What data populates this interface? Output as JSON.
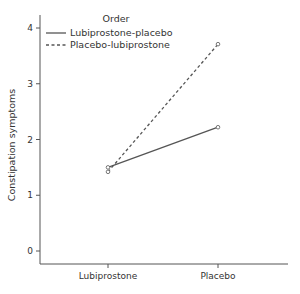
{
  "chart_data": {
    "type": "line",
    "title": "",
    "xlabel": "",
    "ylabel": "Constipation symptoms",
    "categories": [
      "Lubiprostone",
      "Placebo"
    ],
    "ylim": [
      -0.3,
      4.2
    ],
    "yticks": [
      0,
      1,
      2,
      3,
      4
    ],
    "grid": false,
    "legend": {
      "title": "Order",
      "position": "top-left"
    },
    "series": [
      {
        "name": "Lubiprostone-placebo",
        "style": "solid",
        "values": [
          1.5,
          2.22
        ]
      },
      {
        "name": "Placebo-lubiprostone",
        "style": "dashed",
        "values": [
          1.42,
          3.71
        ]
      }
    ],
    "colors": {
      "line": "#555555",
      "axis": "#555555",
      "text": "#333333"
    }
  }
}
